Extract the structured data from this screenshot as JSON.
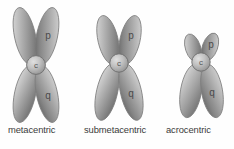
{
  "figure": {
    "background_color": "#fefefe",
    "arm_fill_light": "#d8d8d8",
    "arm_fill_mid": "#a8a8a8",
    "arm_fill_dark": "#6f6f6f",
    "arm_stroke": "#787878",
    "centromere_fill": "#c0c0c0",
    "centromere_stroke": "#6d6d6d",
    "label_color": "#3b3b3b"
  },
  "chromosomes": [
    {
      "id": "metacentric",
      "label": "metacentric",
      "short_arm_label": "p",
      "long_arm_label": "q",
      "centromere_label": "c",
      "centromere_position": "central",
      "short_arm_relative_length": 1.0,
      "long_arm_relative_length": 1.0
    },
    {
      "id": "submetacentric",
      "label": "submetacentric",
      "short_arm_label": "p",
      "long_arm_label": "q",
      "centromere_label": "c",
      "centromere_position": "off-center",
      "short_arm_relative_length": 0.85,
      "long_arm_relative_length": 1.0
    },
    {
      "id": "acrocentric",
      "label": "acrocentric",
      "short_arm_label": "p",
      "long_arm_label": "q",
      "centromere_label": "c",
      "centromere_position": "near-terminal",
      "short_arm_relative_length": 0.38,
      "long_arm_relative_length": 1.0
    }
  ]
}
